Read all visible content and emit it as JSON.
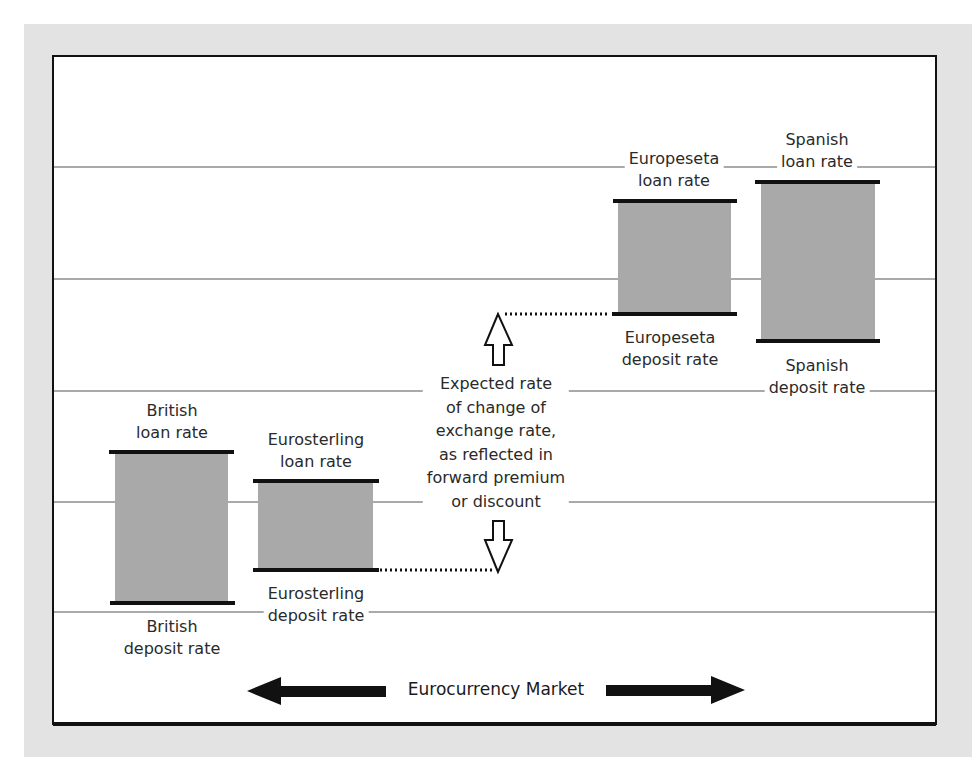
{
  "diagram": {
    "colors": {
      "frame_background": "#e3e3e3",
      "panel": "#ffffff",
      "border": "#111111",
      "gridline": "#555555",
      "box_fill": "#a9a9a9",
      "rate_bar": "#111111",
      "text": "#2a2a2a"
    },
    "gridlines_y": [
      167,
      279,
      391,
      502,
      612
    ],
    "boxes": [
      {
        "id": "british",
        "loan_label": [
          "British",
          "loan rate"
        ],
        "deposit_label": [
          "British",
          "deposit rate"
        ]
      },
      {
        "id": "eurosterling",
        "loan_label": [
          "Eurosterling",
          "loan rate"
        ],
        "deposit_label": [
          "Eurosterling",
          "deposit rate"
        ]
      },
      {
        "id": "europeseta",
        "loan_label": [
          "Europeseta",
          "loan rate"
        ],
        "deposit_label": [
          "Europeseta",
          "deposit rate"
        ]
      },
      {
        "id": "spanish",
        "loan_label": [
          "Spanish",
          "loan rate"
        ],
        "deposit_label": [
          "Spanish",
          "deposit rate"
        ]
      }
    ],
    "annotation": {
      "lines": [
        "Expected rate",
        "of change of",
        "exchange rate,",
        "as reflected in",
        "forward premium",
        "or discount"
      ],
      "up_arrow_icon": "hollow-up-arrow",
      "down_arrow_icon": "hollow-down-arrow"
    },
    "market_arrow": {
      "label": "Eurocurrency Market",
      "icon": "double-headed-arrow"
    }
  }
}
